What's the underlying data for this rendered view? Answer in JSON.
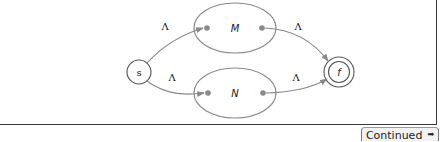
{
  "diagram": {
    "type": "NFA construction (union of machines M and N)",
    "colors": {
      "edge": "#8a8a8a",
      "node_stroke": "#555555",
      "ellipse_stroke": "#8a8a8a",
      "dot": "#8a8a8a",
      "border": "#3a3a3a"
    },
    "nodes": [
      {
        "id": "s",
        "label": "s",
        "kind": "start-state"
      },
      {
        "id": "M",
        "label": "M",
        "kind": "machine"
      },
      {
        "id": "N",
        "label": "N",
        "kind": "machine"
      },
      {
        "id": "f",
        "label": "f",
        "kind": "final-state"
      }
    ],
    "edges": [
      {
        "from": "s",
        "to": "M-start",
        "label": "Λ"
      },
      {
        "from": "s",
        "to": "N-start",
        "label": "Λ"
      },
      {
        "from": "M-final",
        "to": "f",
        "label": "Λ"
      },
      {
        "from": "N-final",
        "to": "f",
        "label": "Λ"
      }
    ]
  },
  "footer": {
    "continued_label": "Continued",
    "continued_icon": "arrow-right-icon",
    "continued_glyph": "➡"
  }
}
